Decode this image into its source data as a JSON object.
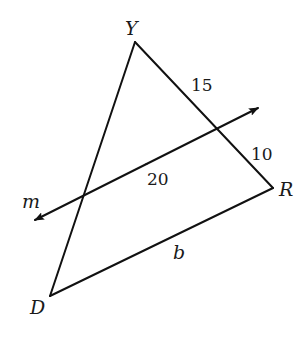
{
  "diagram": {
    "type": "geometry",
    "vertices": {
      "Y": {
        "label": "Y",
        "x": 135,
        "y": 42
      },
      "R": {
        "label": "R",
        "x": 273,
        "y": 188
      },
      "D": {
        "label": "D",
        "x": 50,
        "y": 296
      }
    },
    "line_m": {
      "label": "m",
      "start": {
        "x": 35,
        "y": 220
      },
      "end": {
        "x": 258,
        "y": 108
      },
      "arrows": "both"
    },
    "measurements": {
      "upper_YR_segment": "15",
      "lower_YR_segment": "10",
      "segment_on_m": "20",
      "side_DR": "b"
    },
    "colors": {
      "stroke": "#111111",
      "text": "#1a1a1a",
      "background": "#ffffff"
    }
  }
}
